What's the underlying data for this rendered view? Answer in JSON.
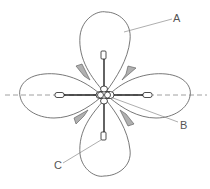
{
  "diagram": {
    "type": "four-leaf radiation pattern with crossed dipole array",
    "labels": {
      "a": "A",
      "b": "B",
      "c": "C"
    },
    "colors": {
      "outline": "#555555",
      "element": "#222222",
      "axis_dash": "#777777",
      "side_lobe_fill": "#aaaaaa"
    }
  }
}
